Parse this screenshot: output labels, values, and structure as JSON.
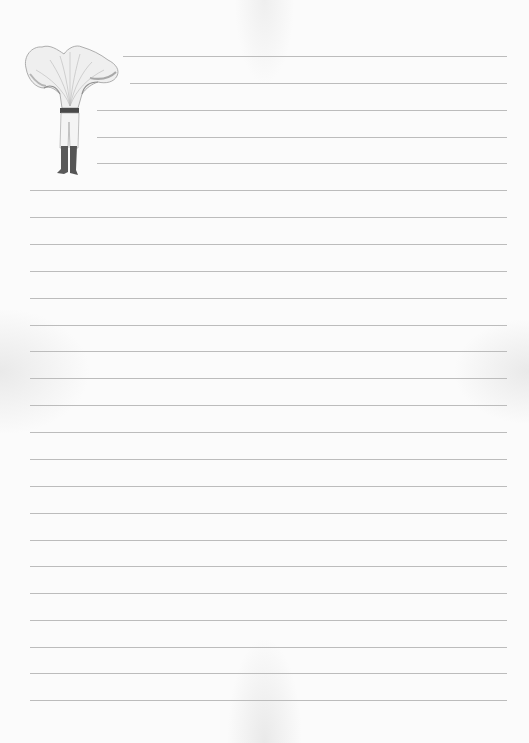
{
  "page": {
    "type": "lined-stationery",
    "background_color": "#fbfbfb",
    "line_color": "#bcbcbc",
    "line_right_edge": 507
  },
  "illustration": {
    "subject": "figure-with-chanterelle-mushroom-head",
    "description": "Person wearing shorts and dark boots with a large chanterelle mushroom as a head"
  },
  "short_lines": [
    {
      "y": 56,
      "x_start": 123
    },
    {
      "y": 83,
      "x_start": 130
    },
    {
      "y": 110,
      "x_start": 97
    },
    {
      "y": 137,
      "x_start": 97
    },
    {
      "y": 163,
      "x_start": 97
    }
  ],
  "full_lines": {
    "x_start": 30,
    "y_positions": [
      190,
      217,
      244,
      271,
      298,
      325,
      351,
      378,
      405,
      432,
      459,
      486,
      513,
      540,
      566,
      593,
      620,
      647,
      673,
      700
    ]
  }
}
